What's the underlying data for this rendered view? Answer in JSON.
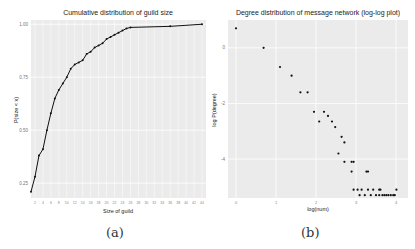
{
  "chart_data": [
    {
      "type": "line",
      "title": "Cumulative distribution of guild size",
      "xlabel": "Size of guild",
      "ylabel": "P(size < x)",
      "caption": "(a)",
      "grid": true,
      "legend": null,
      "x_ticks": [
        2,
        4,
        6,
        8,
        10,
        12,
        14,
        16,
        18,
        20,
        22,
        24,
        26,
        28,
        30,
        32,
        34,
        36,
        38,
        40,
        42,
        44
      ],
      "y_ticks": [
        0.25,
        0.5,
        0.75,
        1.0
      ],
      "y_tick_labels": [
        "0.25",
        "0.50",
        "0.75",
        "1.00"
      ],
      "xlim": [
        1,
        45
      ],
      "ylim": [
        0.18,
        1.02
      ],
      "x": [
        1,
        2,
        3,
        4,
        5,
        6,
        7,
        8,
        9,
        10,
        11,
        12,
        13,
        14,
        15,
        16,
        17,
        18,
        19,
        20,
        21,
        22,
        23,
        24,
        25,
        26,
        36,
        44
      ],
      "values": [
        0.21,
        0.28,
        0.38,
        0.41,
        0.5,
        0.58,
        0.65,
        0.69,
        0.72,
        0.75,
        0.79,
        0.81,
        0.82,
        0.83,
        0.86,
        0.87,
        0.89,
        0.9,
        0.91,
        0.93,
        0.94,
        0.95,
        0.96,
        0.97,
        0.98,
        0.985,
        0.99,
        1.0
      ]
    },
    {
      "type": "scatter",
      "title": "Degree distribution of message network (log-log plot)",
      "xlabel": "log(num)",
      "ylabel": "log P(degree)",
      "caption": "(b)",
      "grid": true,
      "legend": null,
      "x_ticks": [
        0,
        1,
        2,
        3,
        4
      ],
      "y_ticks": [
        0,
        -2,
        -4
      ],
      "xlim": [
        -0.2,
        4.3
      ],
      "ylim": [
        -5.4,
        1.0
      ],
      "points": [
        [
          0.0,
          0.7
        ],
        [
          0.69,
          0.0
        ],
        [
          1.1,
          -0.69
        ],
        [
          1.39,
          -1.0
        ],
        [
          1.61,
          -1.6
        ],
        [
          1.79,
          -1.6
        ],
        [
          1.95,
          -2.3
        ],
        [
          2.2,
          -2.3
        ],
        [
          2.3,
          -2.45
        ],
        [
          2.08,
          -2.65
        ],
        [
          2.4,
          -2.65
        ],
        [
          2.48,
          -2.85
        ],
        [
          2.64,
          -3.2
        ],
        [
          2.71,
          -3.4
        ],
        [
          2.56,
          -3.8
        ],
        [
          2.71,
          -4.1
        ],
        [
          2.94,
          -4.1
        ],
        [
          2.89,
          -4.1
        ],
        [
          3.26,
          -4.45
        ],
        [
          3.3,
          -4.45
        ],
        [
          2.89,
          -4.45
        ],
        [
          2.94,
          -5.1
        ],
        [
          3.04,
          -5.1
        ],
        [
          3.14,
          -5.1
        ],
        [
          3.3,
          -5.1
        ],
        [
          3.43,
          -5.1
        ],
        [
          3.58,
          -5.1
        ],
        [
          3.61,
          -5.1
        ],
        [
          4.01,
          -5.1
        ],
        [
          3.09,
          -5.3
        ],
        [
          3.22,
          -5.3
        ],
        [
          3.37,
          -5.3
        ],
        [
          3.5,
          -5.3
        ],
        [
          3.58,
          -5.3
        ],
        [
          3.66,
          -5.3
        ],
        [
          3.71,
          -5.3
        ],
        [
          3.76,
          -5.3
        ],
        [
          3.81,
          -5.3
        ],
        [
          3.87,
          -5.3
        ],
        [
          3.93,
          -5.3
        ],
        [
          3.97,
          -5.3
        ]
      ]
    }
  ]
}
